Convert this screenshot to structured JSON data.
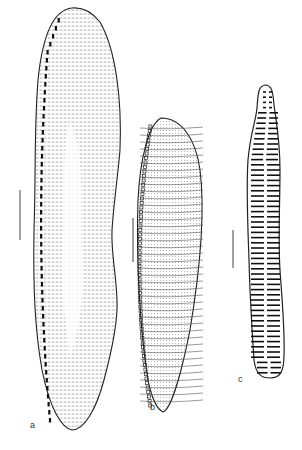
{
  "figure": {
    "panels": [
      {
        "id": "a",
        "label": "a",
        "description": "large elongate valve with fine punctate striae and marginal fibulae"
      },
      {
        "id": "b",
        "label": "b",
        "description": "lanceolate valve with transverse striae and marginal keel"
      },
      {
        "id": "c",
        "label": "c",
        "description": "narrow constricted valve with coarse transverse costae"
      }
    ],
    "scale_bars": 3,
    "colors": {
      "ink": "#222222",
      "background": "#ffffff"
    }
  }
}
